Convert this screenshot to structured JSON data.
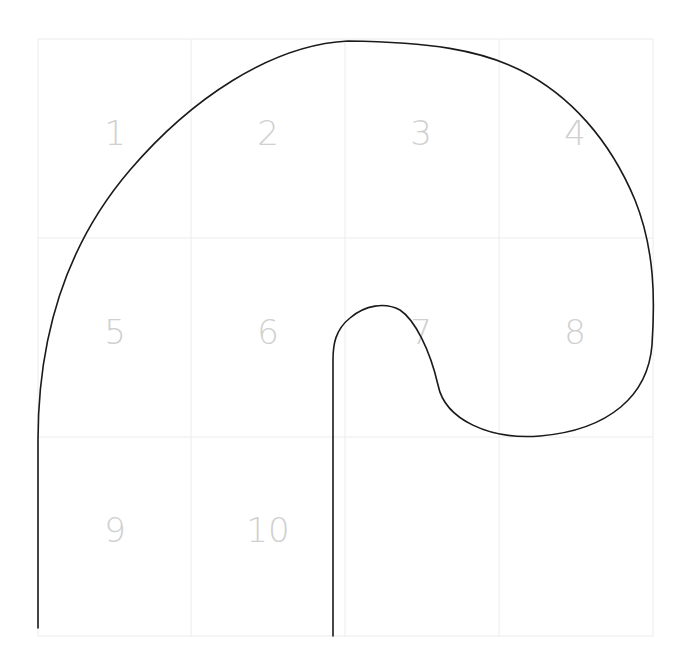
{
  "diagram": {
    "type": "handwriting-grid-trace",
    "grid": {
      "columns": 4,
      "rows": 3,
      "color": "#ececec",
      "col_x": [
        38,
        191,
        345,
        499,
        653
      ],
      "row_y": [
        39,
        238,
        437,
        636
      ]
    },
    "cells": [
      {
        "label": "1",
        "x": 115,
        "y": 133
      },
      {
        "label": "2",
        "x": 268,
        "y": 133
      },
      {
        "label": "3",
        "x": 421,
        "y": 133
      },
      {
        "label": "4",
        "x": 575,
        "y": 133
      },
      {
        "label": "5",
        "x": 115,
        "y": 332
      },
      {
        "label": "6",
        "x": 268,
        "y": 332
      },
      {
        "label": "7",
        "x": 421,
        "y": 332
      },
      {
        "label": "8",
        "x": 575,
        "y": 332
      },
      {
        "label": "9",
        "x": 115,
        "y": 530
      },
      {
        "label": "10",
        "x": 268,
        "y": 530
      }
    ],
    "cell_label_color": "#d0d0d0",
    "stroke": {
      "color": "#1a1a1a",
      "path": "M38,628 L38,440 C38,330 70,240 130,170 C190,100 270,45 348,41 C430,42 480,50 520,70 C570,95 610,140 635,200 C655,250 655,300 652,345 C648,395 610,430 540,436 C490,440 445,420 438,385 C430,350 415,320 400,310 C385,302 365,305 350,318 C335,330 333,345 333,360 L333,636"
    }
  }
}
